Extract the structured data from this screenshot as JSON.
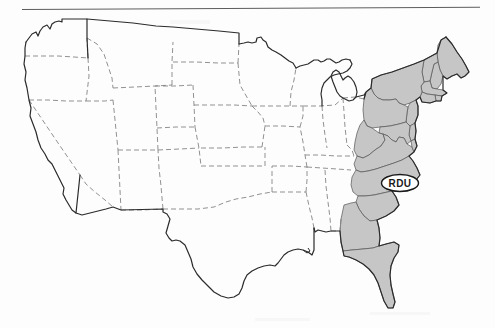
{
  "document": {
    "title": "United States map with eastern region shaded",
    "type": "scanned-map",
    "background_color": "#fdfdfd"
  },
  "rule": {
    "name": "horizontal-rule",
    "color": "#5d5d5d"
  },
  "map": {
    "name": "united-states-map",
    "outline_color": "#2b2b2b",
    "state_border_color": "#6a6a6a",
    "shaded_fill": "#c6c6c6",
    "unshaded_fill": "#ffffff",
    "shaded_region_label": "Eastern United States",
    "shaded_states": [
      "Maine",
      "New Hampshire",
      "Vermont",
      "Massachusetts",
      "Rhode Island",
      "Connecticut",
      "New York",
      "New Jersey",
      "Pennsylvania",
      "Delaware",
      "Maryland",
      "West Virginia",
      "Virginia",
      "North Carolina",
      "South Carolina",
      "Georgia",
      "Florida"
    ],
    "unshaded_states": [
      "Washington",
      "Oregon",
      "California",
      "Idaho",
      "Nevada",
      "Montana",
      "Wyoming",
      "Utah",
      "Arizona",
      "Colorado",
      "New Mexico",
      "North Dakota",
      "South Dakota",
      "Nebraska",
      "Kansas",
      "Oklahoma",
      "Texas",
      "Minnesota",
      "Iowa",
      "Missouri",
      "Arkansas",
      "Louisiana",
      "Wisconsin",
      "Illinois",
      "Michigan",
      "Indiana",
      "Ohio",
      "Kentucky",
      "Tennessee",
      "Mississippi",
      "Alabama"
    ]
  },
  "callout": {
    "name": "rdu-airport-callout",
    "label": "RDU",
    "shape": "ellipse",
    "outline_color": "#1a1a1a",
    "fill_color": "#ffffff",
    "center_x": 400,
    "center_y": 183
  }
}
